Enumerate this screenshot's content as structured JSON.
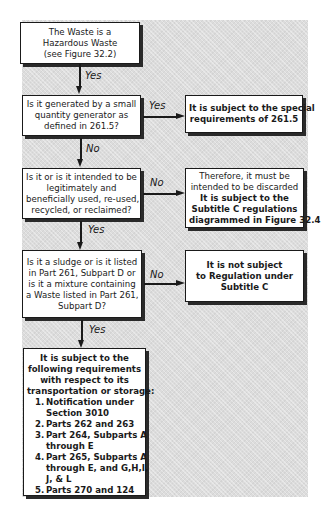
{
  "flowchart": {
    "start": {
      "lines": [
        "The Waste is a",
        "Hazardous Waste",
        "(see Figure 32.2)"
      ]
    },
    "q1": {
      "lines": [
        "Is it generated by a small",
        "quantity generator as",
        "defined in 261.5?"
      ],
      "yes_label": "Yes",
      "no_label": "No"
    },
    "r1": {
      "lines": [
        "It is subject to the special",
        "requirements of  261.5"
      ]
    },
    "q2": {
      "lines": [
        "Is it or is it intended to be",
        "legitimately and",
        "beneficially used, re-used,",
        "recycled, or reclaimed?"
      ],
      "yes_label": "Yes",
      "no_label": "No"
    },
    "r2": {
      "plain_lines": [
        "Therefore, it must be",
        "intended to be discarded"
      ],
      "bold_lines": [
        "It is subject to the",
        "Subtitle C regulations",
        "diagrammed in Figure 32.4"
      ]
    },
    "q3": {
      "lines": [
        "Is it a sludge or is it listed",
        "in Part 261, Subpart D or",
        "is it a mixture containing",
        "a Waste listed in Part 261,",
        "Subpart D?"
      ],
      "yes_label": "Yes",
      "no_label": "No"
    },
    "r3": {
      "lines": [
        "It is not subject",
        "to Regulation under",
        "Subtitle C"
      ]
    },
    "start_yes_label": "Yes",
    "final": {
      "intro_lines": [
        "It is subject to the",
        "following requirements",
        "with respect to its",
        "transportation or storage:"
      ],
      "items": [
        {
          "num": "1.",
          "lines": [
            "Notification under",
            "Section 3010"
          ]
        },
        {
          "num": "2.",
          "lines": [
            "Parts 262 and 263"
          ]
        },
        {
          "num": "3.",
          "lines": [
            "Part 264, Subparts A",
            "through E"
          ]
        },
        {
          "num": "4.",
          "lines": [
            "Part 265, Subparts A",
            "through E, and G,H,I,",
            "J, & L"
          ]
        },
        {
          "num": "5.",
          "lines": [
            "Parts 270 and 124"
          ]
        }
      ]
    }
  },
  "colors": {
    "background_panel": "#dcdcdc",
    "box_fill": "#ffffff",
    "stroke": "#1a1a1a"
  }
}
